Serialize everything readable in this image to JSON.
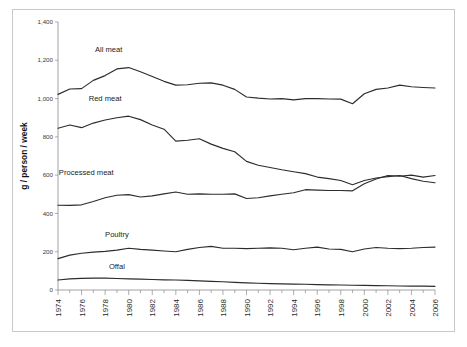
{
  "chart_data": {
    "type": "line",
    "title": "",
    "subtitle": "",
    "xlabel": "",
    "ylabel": "g / person / week",
    "xlim": [
      1974,
      2006
    ],
    "ylim": [
      0,
      1400
    ],
    "ytick_labels": [
      "0",
      "200",
      "400",
      "600",
      "800",
      "1,000",
      "1,200",
      "1,400"
    ],
    "ytick_values": [
      0,
      200,
      400,
      600,
      800,
      1000,
      1200,
      1400
    ],
    "xtick_labels": [
      "1974",
      "1976",
      "1978",
      "1980",
      "1982",
      "1984",
      "1986",
      "1988",
      "1990",
      "1992",
      "1994",
      "1996",
      "1998",
      "2000",
      "2002",
      "2004",
      "2006"
    ],
    "xtick_values": [
      1974,
      1976,
      1978,
      1980,
      1982,
      1984,
      1986,
      1988,
      1990,
      1992,
      1994,
      1996,
      1998,
      2000,
      2002,
      2004,
      2006
    ],
    "minor_xticks": true,
    "grid": false,
    "legend": "inline-labels",
    "line_color": "#2c2c2c",
    "x": [
      1974,
      1975,
      1976,
      1977,
      1978,
      1979,
      1980,
      1981,
      1982,
      1983,
      1984,
      1985,
      1986,
      1987,
      1988,
      1989,
      1990,
      1991,
      1992,
      1993,
      1994,
      1995,
      1996,
      1997,
      1998,
      1999,
      2000,
      2001,
      2002,
      2003,
      2004,
      2005,
      2006
    ],
    "series": [
      {
        "name": "All meat",
        "label": "All meat",
        "label_x": 1978.3,
        "label_y": 1245,
        "values": [
          1022,
          1050,
          1052,
          1095,
          1120,
          1155,
          1162,
          1140,
          1115,
          1090,
          1070,
          1072,
          1080,
          1082,
          1070,
          1048,
          1008,
          1002,
          998,
          1000,
          993,
          1000,
          1000,
          998,
          997,
          973,
          1025,
          1048,
          1055,
          1070,
          1062,
          1058,
          1055
        ]
      },
      {
        "name": "Red meat",
        "label": "Red meat",
        "label_x": 1978.0,
        "label_y": 985,
        "values": [
          845,
          862,
          848,
          872,
          888,
          900,
          908,
          890,
          862,
          840,
          778,
          782,
          790,
          762,
          740,
          722,
          672,
          652,
          640,
          628,
          618,
          608,
          590,
          582,
          572,
          550,
          572,
          585,
          592,
          598,
          582,
          568,
          560
        ]
      },
      {
        "name": "Processed meat",
        "label": "Processed meat",
        "label_x": 1976.4,
        "label_y": 600,
        "values": [
          443,
          442,
          445,
          462,
          482,
          495,
          498,
          486,
          492,
          502,
          512,
          500,
          502,
          500,
          500,
          502,
          478,
          482,
          492,
          500,
          508,
          524,
          522,
          520,
          520,
          518,
          555,
          580,
          598,
          594,
          600,
          590,
          598
        ]
      },
      {
        "name": "Poultry",
        "label": "Poultry",
        "label_x": 1979.0,
        "label_y": 278,
        "values": [
          164,
          182,
          192,
          198,
          202,
          208,
          218,
          212,
          208,
          204,
          200,
          212,
          222,
          228,
          218,
          218,
          216,
          218,
          220,
          218,
          210,
          218,
          224,
          214,
          212,
          200,
          214,
          222,
          218,
          216,
          218,
          222,
          224
        ]
      },
      {
        "name": "Offal",
        "label": "Offal",
        "label_x": 1979.0,
        "label_y": 108,
        "values": [
          52,
          58,
          61,
          62,
          62,
          60,
          58,
          57,
          55,
          53,
          52,
          50,
          48,
          45,
          43,
          40,
          37,
          35,
          33,
          32,
          31,
          30,
          28,
          27,
          26,
          25,
          24,
          23,
          22,
          21,
          20,
          20,
          19
        ]
      }
    ]
  }
}
